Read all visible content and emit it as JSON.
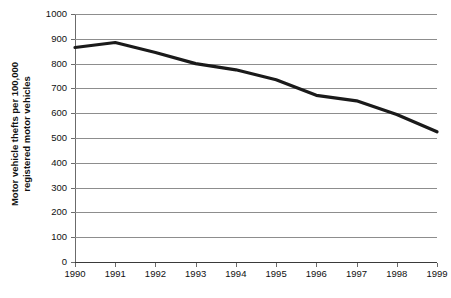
{
  "chart_data": {
    "type": "line",
    "title": "",
    "subtitle": "",
    "xlabel": "",
    "ylabel": "Motor vehicle thefts per 100,000 registered motor vehicles",
    "ylabel_lines": [
      "Motor vehicle thefts per 100,000",
      "registered motor vehicles"
    ],
    "categories": [
      "1990",
      "1991",
      "1992",
      "1993",
      "1994",
      "1995",
      "1996",
      "1997",
      "1998",
      "1999"
    ],
    "x": [
      1990,
      1991,
      1992,
      1993,
      1994,
      1995,
      1996,
      1997,
      1998,
      1999
    ],
    "values": [
      865,
      885,
      845,
      800,
      775,
      735,
      672,
      650,
      595,
      525
    ],
    "series": [
      {
        "name": "Motor vehicle thefts per 100,000 registered motor vehicles",
        "values": [
          865,
          885,
          845,
          800,
          775,
          735,
          672,
          650,
          595,
          525
        ]
      }
    ],
    "ylim": [
      0,
      1000
    ],
    "ytick_labels": [
      "1000",
      "900",
      "800",
      "700",
      "600",
      "500",
      "400",
      "300",
      "200",
      "100",
      "0"
    ],
    "ytick_values": [
      1000,
      900,
      800,
      700,
      600,
      500,
      400,
      300,
      200,
      100,
      0
    ],
    "xtick_labels": [
      "1990",
      "1991",
      "1992",
      "1993",
      "1994",
      "1995",
      "1996",
      "1997",
      "1998",
      "1999"
    ],
    "grid": true,
    "legend": false,
    "legend_position": "none",
    "line_color": "#1a1a1a",
    "grid_color": "#8d8d8d",
    "axis_color": "#6b6b6b",
    "background_color": "#ffffff"
  }
}
